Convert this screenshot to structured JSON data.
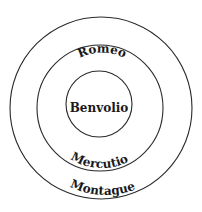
{
  "diagram": {
    "type": "concentric-circles",
    "rings": [
      {
        "id": "outer",
        "label": "Montague"
      },
      {
        "id": "middle",
        "label_top": "Romeo",
        "label_bottom": "Mercutio"
      },
      {
        "id": "inner",
        "label": "Benvolio"
      }
    ],
    "labels": {
      "outer": "Montague",
      "middle_top": "Romeo",
      "middle_bottom": "Mercutio",
      "inner": "Benvolio"
    },
    "colors": {
      "stroke": "#2a2a2a",
      "text": "#1a1a1a",
      "background": "#ffffff"
    }
  }
}
